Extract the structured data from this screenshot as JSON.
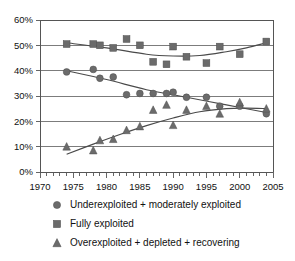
{
  "chart_data": {
    "type": "scatter",
    "title": "",
    "subtitle": "",
    "xlabel": "",
    "ylabel": "",
    "xlim": [
      1970,
      2005
    ],
    "ylim": [
      0,
      60
    ],
    "grid": true,
    "legend_position": "bottom",
    "y_ticks": [
      "0%",
      "10%",
      "20%",
      "30%",
      "40%",
      "50%",
      "60%"
    ],
    "y_tick_values": [
      0,
      10,
      20,
      30,
      40,
      50,
      60
    ],
    "x_ticks": [
      "1970",
      "1975",
      "1980",
      "1985",
      "1990",
      "1995",
      "2000",
      "2005"
    ],
    "x_tick_values": [
      1970,
      1975,
      1980,
      1985,
      1990,
      1995,
      2000,
      2005
    ],
    "x_minor_step": 1,
    "marker_color": "#6b6b6b",
    "trend_color": "#4a4a4a",
    "series": [
      {
        "name": "Underexploited + moderately exploited",
        "marker": "circle",
        "x": [
          1974,
          1978,
          1979,
          1981,
          1983,
          1985,
          1987,
          1989,
          1990,
          1992,
          1995,
          1997,
          2000,
          2004
        ],
        "values": [
          39.5,
          40.5,
          37.0,
          37.5,
          30.5,
          31.0,
          31.0,
          31.0,
          31.5,
          29.5,
          29.5,
          26.0,
          26.0,
          23.0
        ],
        "trend": {
          "x": [
            1974,
            1980,
            1986,
            1992,
            1998,
            2004
          ],
          "values": [
            40.0,
            36.5,
            32.5,
            29.5,
            26.5,
            23.5
          ]
        }
      },
      {
        "name": "Fully exploited",
        "marker": "square",
        "x": [
          1974,
          1978,
          1979,
          1981,
          1983,
          1985,
          1987,
          1989,
          1990,
          1992,
          1995,
          1997,
          2000,
          2004
        ],
        "values": [
          50.5,
          50.5,
          50.0,
          49.0,
          52.5,
          50.0,
          43.5,
          42.5,
          49.5,
          45.5,
          43.0,
          49.5,
          46.5,
          51.5
        ],
        "trend": {
          "x": [
            1974,
            1980,
            1986,
            1990,
            1994,
            1998,
            2001,
            2004
          ],
          "values": [
            51.0,
            49.0,
            46.5,
            45.8,
            46.0,
            47.5,
            49.0,
            51.0
          ]
        }
      },
      {
        "name": "Overexploited + depleted + recovering",
        "marker": "triangle",
        "x": [
          1974,
          1978,
          1979,
          1981,
          1983,
          1985,
          1987,
          1989,
          1990,
          1992,
          1995,
          1997,
          2000,
          2004
        ],
        "values": [
          10.0,
          8.5,
          12.5,
          13.0,
          16.5,
          18.0,
          24.5,
          26.5,
          18.5,
          24.5,
          26.0,
          23.0,
          27.5,
          25.0
        ],
        "trend": {
          "x": [
            1974,
            1978,
            1982,
            1986,
            1990,
            1994,
            1998,
            2001,
            2004
          ],
          "values": [
            7.0,
            11.0,
            14.8,
            18.3,
            21.3,
            23.8,
            25.0,
            25.2,
            25.0
          ]
        }
      }
    ],
    "legend": [
      {
        "marker": "circle",
        "label": "Underexploited + moderately exploited"
      },
      {
        "marker": "square",
        "label": "Fully exploited"
      },
      {
        "marker": "triangle",
        "label": "Overexploited + depleted + recovering"
      }
    ]
  }
}
